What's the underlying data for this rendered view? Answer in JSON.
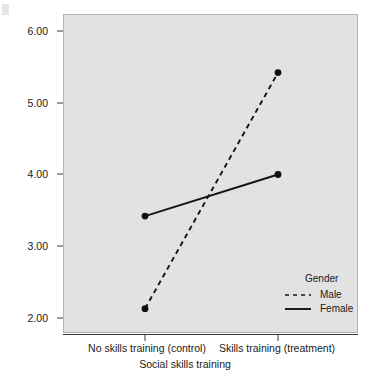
{
  "chart_data": {
    "type": "line",
    "title": "",
    "xlabel": "Social skills training",
    "ylabel": "Mean number of appropriate interactions",
    "categories": [
      "No skills training (control)",
      "Skills training (treatment)"
    ],
    "series": [
      {
        "name": "Male",
        "values": [
          2.13,
          5.42
        ],
        "style": "dashed",
        "marker": "filled-circle"
      },
      {
        "name": "Female",
        "values": [
          3.42,
          4.0
        ],
        "style": "solid",
        "marker": "filled-circle"
      }
    ],
    "ylim": [
      1.75,
      6.25
    ],
    "yticks": [
      "2.00",
      "3.00",
      "4.00",
      "5.00",
      "6.00"
    ],
    "ytick_values": [
      2.0,
      3.0,
      4.0,
      5.0,
      6.0
    ],
    "grid": false,
    "legend": {
      "title": "Gender",
      "position": "inside-bottom-right",
      "entries": [
        "Male",
        "Female"
      ]
    },
    "colors": {
      "line": "#1a1a1a",
      "marker": "#111111",
      "panel_background": "#e2e2e2",
      "page_background": "#ffffff",
      "axis": "#3a3a3a"
    }
  }
}
